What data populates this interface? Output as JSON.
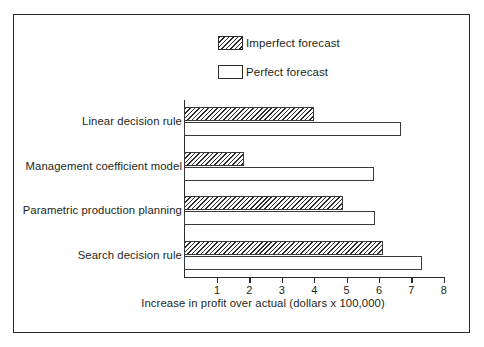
{
  "chart_data": {
    "type": "bar",
    "orientation": "horizontal",
    "title": "",
    "xlabel": "Increase in profit over actual  (dollars x 100,000)",
    "ylabel": "",
    "xlim": [
      0,
      8
    ],
    "xticks": [
      1,
      2,
      3,
      4,
      5,
      6,
      7,
      8
    ],
    "grid": false,
    "legend_position": "top-center",
    "categories": [
      "Linear decision rule",
      "Management coefficient model",
      "Parametric production planning",
      "Search decision rule"
    ],
    "series": [
      {
        "name": "Imperfect forecast",
        "fill": "hatched",
        "values": [
          4.0,
          1.85,
          4.9,
          6.15
        ]
      },
      {
        "name": "Perfect forecast",
        "fill": "white",
        "values": [
          6.7,
          5.85,
          5.9,
          7.35
        ]
      }
    ]
  },
  "legend": {
    "items": [
      {
        "label": "Imperfect forecast",
        "swatch": "hatched-swatch-icon"
      },
      {
        "label": "Perfect forecast",
        "swatch": "empty-swatch-icon"
      }
    ]
  },
  "colors": {
    "ink": "#2b2b2b",
    "background": "#ffffff"
  }
}
